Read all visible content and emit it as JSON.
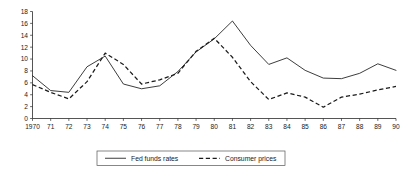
{
  "chart_data": {
    "type": "line",
    "title": "",
    "xlabel": "",
    "ylabel": "",
    "ylim": [
      0,
      18
    ],
    "ytick_step": 2,
    "grid": false,
    "legend_position": "bottom",
    "x": [
      1970,
      1971,
      1972,
      1973,
      1974,
      1975,
      1976,
      1977,
      1978,
      1979,
      1980,
      1981,
      1982,
      1983,
      1984,
      1985,
      1986,
      1987,
      1988,
      1989,
      1990
    ],
    "xtick_labels": [
      "1970",
      "71",
      "72",
      "73",
      "74",
      "75",
      "76",
      "77",
      "78",
      "79",
      "80",
      "81",
      "82",
      "83",
      "84",
      "85",
      "86",
      "87",
      "88",
      "89",
      "90"
    ],
    "ytick_labels": [
      "0",
      "2",
      "4",
      "6",
      "8",
      "10",
      "12",
      "14",
      "16",
      "18"
    ],
    "ytick_values": [
      0,
      2,
      4,
      6,
      8,
      10,
      12,
      14,
      16,
      18
    ],
    "series": [
      {
        "name": "Fed funds rates",
        "style": "solid",
        "color": "#1a1a1a",
        "values": [
          7.2,
          4.7,
          4.4,
          8.7,
          10.5,
          5.8,
          5.0,
          5.5,
          7.9,
          11.2,
          13.4,
          16.4,
          12.3,
          9.1,
          10.2,
          8.1,
          6.8,
          6.7,
          7.6,
          9.2,
          8.1
        ]
      },
      {
        "name": "Consumer prices",
        "style": "dashed",
        "color": "#1a1a1a",
        "values": [
          5.7,
          4.4,
          3.3,
          6.2,
          11.0,
          9.1,
          5.8,
          6.5,
          7.6,
          11.3,
          13.5,
          10.3,
          6.2,
          3.2,
          4.3,
          3.6,
          1.9,
          3.6,
          4.1,
          4.8,
          5.4
        ]
      }
    ],
    "legend": [
      {
        "label": "Fed funds rates",
        "style": "solid"
      },
      {
        "label": "Consumer prices",
        "style": "dashed"
      }
    ]
  }
}
